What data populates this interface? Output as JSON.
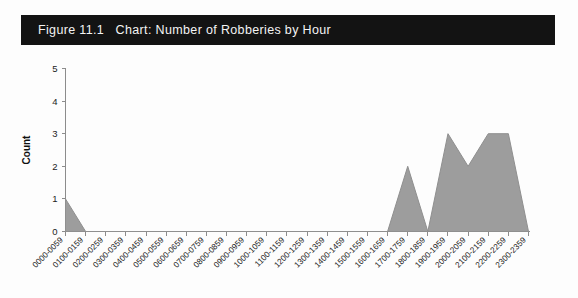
{
  "figure": {
    "banner_label": "Figure 11.1   Chart: Number of Robberies by Hour",
    "banner_bg_color": "#131313",
    "banner_text_color": "#f4f4f4"
  },
  "chart_data": {
    "type": "area",
    "title": "Figure 11.1   Chart: Number of Robberies by Hour",
    "xlabel": "",
    "ylabel": "Count",
    "categories": [
      "0000-0059",
      "0100-0159",
      "0200-0259",
      "0300-0359",
      "0400-0459",
      "0500-0559",
      "0600-0659",
      "0700-0759",
      "0800-0859",
      "0900-0959",
      "1000-1059",
      "1100-1159",
      "1200-1259",
      "1300-1359",
      "1400-1459",
      "1500-1559",
      "1600-1659",
      "1700-1759",
      "1800-1859",
      "1900-1959",
      "2000-2059",
      "2100-2159",
      "2200-2259",
      "2300-2359"
    ],
    "values": [
      1,
      0,
      0,
      0,
      0,
      0,
      0,
      0,
      0,
      0,
      0,
      0,
      0,
      0,
      0,
      0,
      0,
      2,
      0,
      3,
      2,
      3,
      3,
      0
    ],
    "ylim": [
      0,
      5
    ],
    "yticks": [
      0,
      1,
      2,
      3,
      4,
      5
    ],
    "ytick_labels": [
      "0",
      "1",
      "2",
      "3",
      "4",
      "5"
    ],
    "grid": false,
    "legend": false,
    "series_fill_color": "#9d9d9d",
    "series_line_color": "#8f8f8f",
    "axis_color": "#8c8c8c",
    "xtick_rotation_degrees": -45
  }
}
